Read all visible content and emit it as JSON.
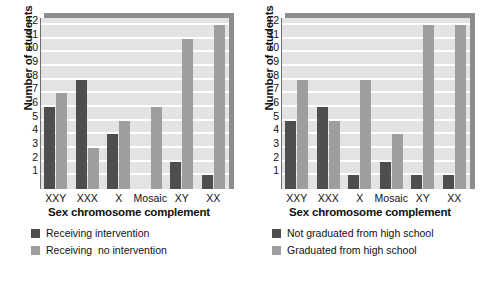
{
  "chart_data": [
    {
      "type": "bar",
      "title": "",
      "panel": "left",
      "categories": [
        "XXY",
        "XXX",
        "X",
        "Mosaic",
        "XY",
        "XX"
      ],
      "series": [
        {
          "name": "Receiving intervention",
          "color": "#4e4e4e",
          "values": [
            6,
            8,
            4,
            0,
            2,
            1
          ]
        },
        {
          "name": "Receiving  no intervention",
          "color": "#9e9e9e",
          "values": [
            7,
            3,
            5,
            6,
            11,
            12
          ]
        }
      ],
      "xlabel": "Sex chromosome complement",
      "ylabel": "Number of students",
      "ylim": [
        0,
        12
      ],
      "yticks": [
        1,
        2,
        3,
        4,
        5,
        6,
        7,
        8,
        9,
        10,
        11,
        12
      ],
      "grid": true,
      "legend_position": "bottom-left"
    },
    {
      "type": "bar",
      "title": "",
      "panel": "right",
      "categories": [
        "XXY",
        "XXX",
        "X",
        "Mosaic",
        "XY",
        "XX"
      ],
      "series": [
        {
          "name": "Not graduated from high school",
          "color": "#4e4e4e",
          "values": [
            5,
            6,
            1,
            2,
            1,
            1
          ]
        },
        {
          "name": "Graduated from high school",
          "color": "#9e9e9e",
          "values": [
            8,
            5,
            8,
            4,
            12,
            12
          ]
        }
      ],
      "xlabel": "Sex chromosome complement",
      "ylabel": "Number of students",
      "ylim": [
        0,
        12
      ],
      "yticks": [
        1,
        2,
        3,
        4,
        5,
        6,
        7,
        8,
        9,
        10,
        11,
        12
      ],
      "grid": true,
      "legend_position": "bottom-left"
    }
  ],
  "colors": {
    "series_dark": "#4e4e4e",
    "series_light": "#9e9e9e",
    "plot_background": "#e3e3e3",
    "gridline": "#ffffff",
    "shadow": "#8d8d8d"
  }
}
